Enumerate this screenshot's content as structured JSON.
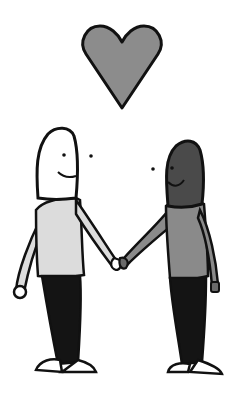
{
  "illustration": {
    "subject": "two figures holding hands under a heart",
    "colors": {
      "heart": "#8c8c8c",
      "left_head": "#ffffff",
      "left_shirt": "#dcdcdc",
      "right_head": "#4a4a4a",
      "right_shirt": "#8a8a8a",
      "pants": "#141414",
      "outline": "#111111"
    }
  }
}
